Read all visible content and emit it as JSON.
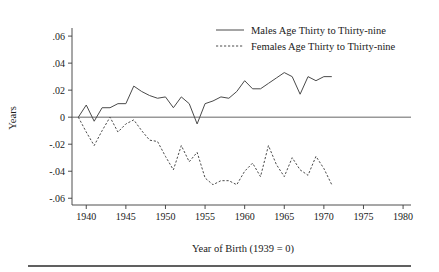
{
  "chart_data": {
    "type": "line",
    "title": "",
    "xlabel": "Year of Birth (1939 = 0)",
    "ylabel": "Years",
    "xlim": [
      1938.2,
      1981
    ],
    "ylim": [
      -0.065,
      0.066
    ],
    "xticks": [
      1940,
      1945,
      1950,
      1955,
      1960,
      1965,
      1970,
      1975,
      1980
    ],
    "xticklabels": [
      "1940",
      "1945",
      "1950",
      "1955",
      "1960",
      "1965",
      "1970",
      "1975",
      "1980"
    ],
    "yticks": [
      0.06,
      0.04,
      0.02,
      0,
      -0.02,
      -0.04,
      -0.06
    ],
    "yticklabels": [
      ".06",
      ".04",
      ".02",
      "0",
      "-.02",
      "-.04",
      "-.06"
    ],
    "grid": false,
    "zero_line": true,
    "legend_position": "top-right",
    "x": [
      1939,
      1940,
      1941,
      1942,
      1943,
      1944,
      1945,
      1946,
      1947,
      1948,
      1949,
      1950,
      1951,
      1952,
      1953,
      1954,
      1955,
      1956,
      1957,
      1958,
      1959,
      1960,
      1961,
      1962,
      1963,
      1964,
      1965,
      1966,
      1967,
      1968,
      1969,
      1970,
      1971
    ],
    "series": [
      {
        "name": "Males Age Thirty to Thirty-nine",
        "style": "solid",
        "color": "#4a4a4a",
        "values": [
          0.0,
          0.009,
          -0.003,
          0.007,
          0.007,
          0.01,
          0.01,
          0.023,
          0.019,
          0.016,
          0.014,
          0.015,
          0.007,
          0.015,
          0.01,
          -0.005,
          0.01,
          0.012,
          0.015,
          0.014,
          0.019,
          0.027,
          0.021,
          0.021,
          0.025,
          0.029,
          0.033,
          0.03,
          0.017,
          0.03,
          0.027,
          0.03,
          0.03
        ]
      },
      {
        "name": "Females Age Thirty to Thirty-nine",
        "style": "dashed",
        "color": "#4a4a4a",
        "values": [
          0.0,
          -0.011,
          -0.021,
          -0.01,
          0.0,
          -0.011,
          -0.005,
          -0.002,
          -0.01,
          -0.017,
          -0.018,
          -0.029,
          -0.039,
          -0.021,
          -0.033,
          -0.026,
          -0.045,
          -0.05,
          -0.047,
          -0.047,
          -0.05,
          -0.04,
          -0.034,
          -0.044,
          -0.021,
          -0.035,
          -0.044,
          -0.03,
          -0.039,
          -0.043,
          -0.029,
          -0.038,
          -0.05
        ]
      }
    ]
  },
  "legend": {
    "entries": [
      {
        "label": "Males Age Thirty to Thirty-nine",
        "style": "solid"
      },
      {
        "label": "Females Age Thirty to Thirty-nine",
        "style": "dashed"
      }
    ]
  },
  "axes": {
    "y_title": "Years",
    "x_title": "Year of Birth (1939 = 0)"
  }
}
